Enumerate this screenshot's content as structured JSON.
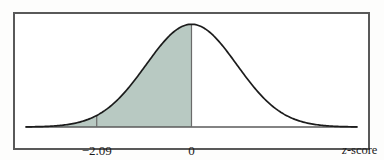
{
  "figure": {
    "name": "standard-normal-curve-with-left-tail-shaded",
    "background_color": "#ffffff",
    "border_color": "#595959",
    "curve_color": "#1c1c1c",
    "shade_color": "#b8c9c2",
    "axis_color": "#5a5a5a"
  },
  "labels": {
    "z_negative": "−2.09",
    "z_zero": "0",
    "axis_title_italic": "z",
    "axis_title_rest": "-score"
  },
  "chart_data": {
    "type": "area",
    "title": "",
    "xlabel": "z-score",
    "ylabel": "",
    "distribution": "standard normal",
    "mean": 0,
    "sd": 1,
    "xlim": [
      -3.65,
      3.65
    ],
    "ylim": [
      0,
      0.4
    ],
    "grid": false,
    "legend": null,
    "tick_values": [
      -2.09,
      0
    ],
    "tick_labels": [
      "−2.09",
      "0"
    ],
    "shaded_region": {
      "from": -3.65,
      "to": 0,
      "boundary_z": -2.09,
      "fill": "#b8c9c2",
      "description": "area under the curve to the left of z = 0 is shaded, with a vertical boundary line drawn at z = -2.09 and at z = 0"
    },
    "vertical_lines": [
      -2.09,
      0
    ],
    "x": [
      -3.65,
      -3.4,
      -3.2,
      -3.0,
      -2.8,
      -2.6,
      -2.4,
      -2.2,
      -2.09,
      -2.0,
      -1.8,
      -1.6,
      -1.4,
      -1.2,
      -1.0,
      -0.8,
      -0.6,
      -0.4,
      -0.2,
      0.0,
      0.2,
      0.4,
      0.6,
      0.8,
      1.0,
      1.2,
      1.4,
      1.6,
      1.8,
      2.0,
      2.2,
      2.4,
      2.6,
      2.8,
      3.0,
      3.2,
      3.4,
      3.65
    ],
    "y": [
      0.0005,
      0.0012,
      0.0024,
      0.0044,
      0.0079,
      0.0136,
      0.0224,
      0.0355,
      0.0449,
      0.054,
      0.079,
      0.1109,
      0.1497,
      0.1942,
      0.242,
      0.2897,
      0.3332,
      0.3683,
      0.391,
      0.3989,
      0.391,
      0.3683,
      0.3332,
      0.2897,
      0.242,
      0.1942,
      0.1497,
      0.1109,
      0.079,
      0.054,
      0.0355,
      0.0224,
      0.0136,
      0.0079,
      0.0044,
      0.0024,
      0.0012,
      0.0005
    ]
  }
}
